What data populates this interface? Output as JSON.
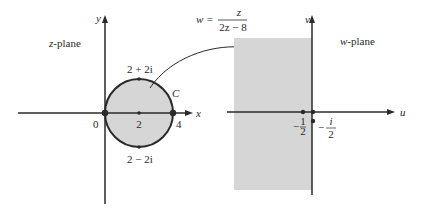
{
  "colors": {
    "ink": "#2a2a2a",
    "shade": "#d6d6d6",
    "background": "#ffffff"
  },
  "z_plane": {
    "label_var": "z",
    "label_suffix": "-plane",
    "axis_x": "x",
    "axis_y": "y",
    "origin_label": "0",
    "center_label": "2",
    "right_label": "4",
    "top_label": "2 + 2i",
    "bottom_label": "2 − 2i",
    "curve_label": "C"
  },
  "mapping": {
    "lhs": "w =",
    "numerator": "z",
    "denominator": "2z − 8"
  },
  "w_plane": {
    "label_var": "w",
    "label_suffix": "-plane",
    "axis_u": "u",
    "axis_v": "v",
    "point_real_sign": "−",
    "point_real_num": "1",
    "point_real_den": "2",
    "point_imag_sign": "−",
    "point_imag_num": "i",
    "point_imag_den": "2"
  }
}
